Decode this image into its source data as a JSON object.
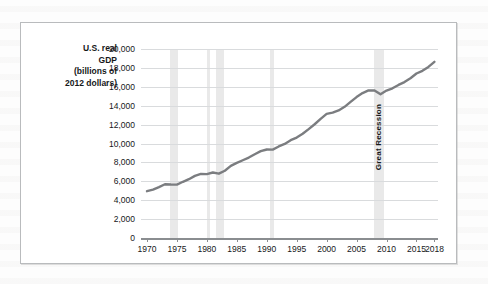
{
  "figure": {
    "axis_title_lines": [
      "U.S. real",
      "GDP",
      "(billions of",
      "2012 dollars)"
    ]
  },
  "chart_data": {
    "type": "line",
    "title": "",
    "xlabel": "",
    "ylabel": "U.S. real GDP (billions of 2012 dollars)",
    "xlim": [
      1969,
      2018.6
    ],
    "ylim": [
      0,
      20000
    ],
    "grid": true,
    "legend": false,
    "line_color": "#7b7d80",
    "band_color": "#e9e9e9",
    "ytick_labels": [
      "20,000",
      "18,000",
      "16,000",
      "14,000",
      "12,000",
      "10,000",
      "8,000",
      "6,000",
      "4,000",
      "2,000",
      "0"
    ],
    "ytick_values": [
      20000,
      18000,
      16000,
      14000,
      12000,
      10000,
      8000,
      6000,
      4000,
      2000,
      0
    ],
    "xtick_labels": [
      "1970",
      "1975",
      "1980",
      "1985",
      "1990",
      "1995",
      "2000",
      "2005",
      "2010",
      "2015",
      "2018"
    ],
    "xtick_values": [
      1970,
      1975,
      1980,
      1985,
      1990,
      1995,
      2000,
      2005,
      2010,
      2015,
      2018
    ],
    "annotations": [
      {
        "text": "Great Recession",
        "x": 2008.5,
        "orientation": "vertical"
      }
    ],
    "recession_bands": [
      {
        "start": 1973.9,
        "end": 1975.2
      },
      {
        "start": 1980.0,
        "end": 1980.6
      },
      {
        "start": 1981.5,
        "end": 1982.9
      },
      {
        "start": 1990.5,
        "end": 1991.2
      },
      {
        "start": 2007.9,
        "end": 2009.5
      }
    ],
    "x": [
      1970,
      1971,
      1972,
      1973,
      1974,
      1975,
      1976,
      1977,
      1978,
      1979,
      1980,
      1981,
      1982,
      1983,
      1984,
      1985,
      1986,
      1987,
      1988,
      1989,
      1990,
      1991,
      1992,
      1993,
      1994,
      1995,
      1996,
      1997,
      1998,
      1999,
      2000,
      2001,
      2002,
      2003,
      2004,
      2005,
      2006,
      2007,
      2008,
      2009,
      2010,
      2011,
      2012,
      2013,
      2014,
      2015,
      2016,
      2017,
      2018
    ],
    "values": [
      4952,
      5115,
      5383,
      5687,
      5656,
      5645,
      5949,
      6224,
      6569,
      6777,
      6759,
      6931,
      6806,
      7118,
      7633,
      7951,
      8226,
      8511,
      8866,
      9193,
      9366,
      9355,
      9685,
      9951,
      10352,
      10630,
      11031,
      11522,
      12038,
      12610,
      13131,
      13262,
      13494,
      13879,
      14406,
      14913,
      15338,
      15626,
      15605,
      15209,
      15599,
      15841,
      16197,
      16495,
      16912,
      17404,
      17689,
      18108,
      18638
    ]
  }
}
